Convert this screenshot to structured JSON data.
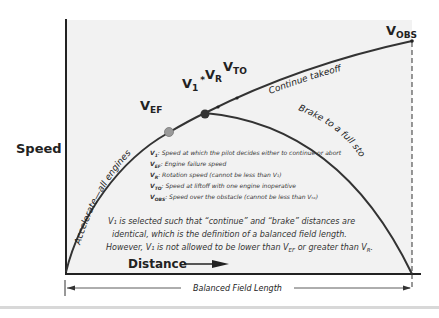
{
  "axes": {
    "y_label": "Speed",
    "x_label": "Distance"
  },
  "curve_labels": {
    "accelerate": "Accelerate—all engines",
    "continue": "Continue takeoff",
    "brake": "Brake to a full stop"
  },
  "points": {
    "vef": {
      "main": "V",
      "sub": "EF"
    },
    "v1": {
      "main": "V",
      "sub": "1",
      "suffix": "*"
    },
    "vr": {
      "main": "V",
      "sub": "R"
    },
    "vto": {
      "main": "V",
      "sub": "TO"
    },
    "vobs": {
      "main": "V",
      "sub": "OBS"
    }
  },
  "legend": [
    {
      "sym": "V",
      "sub": "1",
      "text": ": Speed at which the pilot decides either to continue or abort"
    },
    {
      "sym": "V",
      "sub": "EF",
      "text": ": Engine failure speed"
    },
    {
      "sym": "V",
      "sub": "R",
      "text": ": Rotation speed (cannot be less than V₁)"
    },
    {
      "sym": "V",
      "sub": "TO",
      "text": ": Speed at liftoff with one engine inoperative"
    },
    {
      "sym": "V",
      "sub": "OBS",
      "text": ": Speed over the obstacle (cannot be less than Vₜₒ)"
    }
  ],
  "note": {
    "line1": "V₁ is selected such that “continue” and “brake” distances are",
    "line2": "identical, which is the definition of a balanced field length.",
    "line3_a": "However, V₁ is not allowed to be lower than V",
    "line3_sub1": "EF",
    "line3_b": " or greater than V",
    "line3_sub2": "R",
    "line3_c": "."
  },
  "dimension": {
    "label": "Balanced Field Length"
  },
  "colors": {
    "plot_bg": "#f2f2f2",
    "curve": "#333333",
    "vef_dot": "#9a9a9a",
    "v1_dot": "#333333"
  }
}
